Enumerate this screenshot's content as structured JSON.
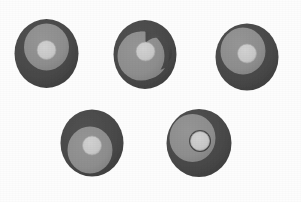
{
  "scene": {
    "title": "Five grayscale concentric disc objects",
    "width": 301,
    "height": 202,
    "background_color": "#fdfdfd",
    "object_count": 5
  },
  "palette": {
    "outer_disc": "#4a4a4a",
    "outer_disc_shadow": "#3f3f3f",
    "mid_disc": "#8e8e8e",
    "mid_disc_edge": "#828282",
    "center_dot": "#c8c8c8",
    "center_dot_edge": "#b4b4b4",
    "background": "#fdfdfd"
  },
  "objects": [
    {
      "id": "disc-1",
      "label": "Top left disc",
      "outer": {
        "cx": 46.5,
        "cy": 53.5,
        "rx": 32,
        "ry": 34.5
      },
      "mid": {
        "cx": 46.5,
        "cy": 47,
        "rx": 22.5,
        "ry": 23.5,
        "rotation": 0
      },
      "center": {
        "cx": 46.5,
        "cy": 50,
        "r": 9.5
      },
      "orientation_deg": 0,
      "swirl": false
    },
    {
      "id": "disc-2",
      "label": "Top middle disc",
      "outer": {
        "cx": 145,
        "cy": 54.5,
        "rx": 31.5,
        "ry": 34.5
      },
      "mid": {
        "cx": 141,
        "cy": 56,
        "rx": 23.5,
        "ry": 24.5,
        "rotation": 195
      },
      "center": {
        "cx": 145.5,
        "cy": 51.5,
        "r": 9.5
      },
      "orientation_deg": 195,
      "swirl": true
    },
    {
      "id": "disc-3",
      "label": "Top right disc",
      "outer": {
        "cx": 247,
        "cy": 57,
        "rx": 31.5,
        "ry": 33.5
      },
      "mid": {
        "cx": 243,
        "cy": 51,
        "rx": 22.5,
        "ry": 23.5,
        "rotation": 330
      },
      "center": {
        "cx": 247,
        "cy": 53.5,
        "r": 9.5
      },
      "orientation_deg": 330,
      "swirl": false
    },
    {
      "id": "disc-4",
      "label": "Bottom left disc",
      "outer": {
        "cx": 92,
        "cy": 143,
        "rx": 31.5,
        "ry": 33.5
      },
      "mid": {
        "cx": 90,
        "cy": 150,
        "rx": 22.5,
        "ry": 23.5,
        "rotation": 180
      },
      "center": {
        "cx": 92,
        "cy": 145.5,
        "r": 9.5
      },
      "orientation_deg": 180,
      "swirl": false
    },
    {
      "id": "disc-5",
      "label": "Bottom right disc",
      "outer": {
        "cx": 199,
        "cy": 143,
        "rx": 32.5,
        "ry": 34
      },
      "mid": {
        "cx": 192.5,
        "cy": 138,
        "rx": 23,
        "ry": 24,
        "rotation": 300
      },
      "center": {
        "cx": 200,
        "cy": 141,
        "r": 9.5
      },
      "orientation_deg": 300,
      "swirl": true
    }
  ]
}
